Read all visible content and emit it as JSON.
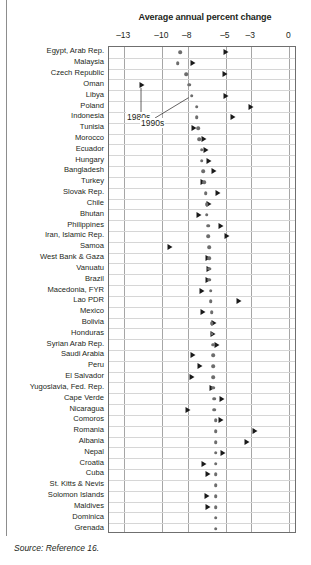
{
  "figure": {
    "source_note": "Source: Reference 16."
  },
  "chart_data": {
    "type": "scatter",
    "title": "Average annual percent change",
    "xlabel": "",
    "ylabel": "",
    "xlim": [
      -14.2,
      0.6
    ],
    "xticks": [
      -13,
      -10,
      -8,
      -5,
      -3,
      0
    ],
    "xtick_labels": [
      "–13",
      "–10",
      "–8",
      "–5",
      "–3",
      "0"
    ],
    "grid": "both",
    "legend_position": "inline-annotation",
    "series": [
      {
        "name": "1980s",
        "marker": "triangle",
        "color": "#1a1a1a"
      },
      {
        "name": "1990s",
        "marker": "circle",
        "color": "#6d6d6d"
      }
    ],
    "annotations": [
      {
        "text": "1980s",
        "points_to_series": "1980s",
        "points_to_category": "Oman"
      },
      {
        "text": "1990s",
        "points_to_series": "1990s",
        "points_to_category": "Libya"
      }
    ],
    "categories": [
      "Egypt, Arab Rep.",
      "Malaysia",
      "Czech Republic",
      "Oman",
      "Libya",
      "Poland",
      "Indonesia",
      "Tunisia",
      "Morocco",
      "Ecuador",
      "Hungary",
      "Bangladesh",
      "Turkey",
      "Slovak Rep.",
      "Chile",
      "Bhutan",
      "Philippines",
      "Iran, Islamic Rep.",
      "Samoa",
      "West Bank & Gaza",
      "Vanuatu",
      "Brazil",
      "Macedonia, FYR",
      "Lao PDR",
      "Mexico",
      "Bolivia",
      "Honduras",
      "Syrian Arab Rep.",
      "Saudi Arabia",
      "Peru",
      "El Salvador",
      "Yugoslavia, Fed. Rep.",
      "Cape Verde",
      "Nicaragua",
      "Comoros",
      "Romania",
      "Albania",
      "Nepal",
      "Croatia",
      "Cuba",
      "St. Kitts & Nevis",
      "Solomon Islands",
      "Maldives",
      "Dominica",
      "Grenada"
    ],
    "points": [
      {
        "category": "Egypt, Arab Rep.",
        "1980s": -5.0,
        "1990s": -8.6
      },
      {
        "category": "Malaysia",
        "1980s": -7.6,
        "1990s": -8.8
      },
      {
        "category": "Czech Republic",
        "1980s": -5.1,
        "1990s": -8.1
      },
      {
        "category": "Oman",
        "1980s": -11.6,
        "1990s": -7.9
      },
      {
        "category": "Libya",
        "1980s": -5.0,
        "1990s": -7.7
      },
      {
        "category": "Poland",
        "1980s": -3.0,
        "1990s": -7.3
      },
      {
        "category": "Indonesia",
        "1980s": -4.4,
        "1990s": -7.3
      },
      {
        "category": "Tunisia",
        "1980s": -7.5,
        "1990s": -7.2
      },
      {
        "category": "Morocco",
        "1980s": -6.7,
        "1990s": -7.1
      },
      {
        "category": "Ecuador",
        "1980s": -6.6,
        "1990s": -6.9
      },
      {
        "category": "Hungary",
        "1980s": -6.3,
        "1990s": -6.9
      },
      {
        "category": "Bangladesh",
        "1980s": -5.9,
        "1990s": -6.8
      },
      {
        "category": "Turkey",
        "1980s": -6.8,
        "1990s": -6.7
      },
      {
        "category": "Slovak Rep.",
        "1980s": -5.6,
        "1990s": -6.6
      },
      {
        "category": "Chile",
        "1980s": -6.3,
        "1990s": -6.5
      },
      {
        "category": "Bhutan",
        "1980s": -7.1,
        "1990s": -6.5
      },
      {
        "category": "Philippines",
        "1980s": -5.4,
        "1990s": -6.4
      },
      {
        "category": "Iran, Islamic Rep.",
        "1980s": -4.9,
        "1990s": -6.4
      },
      {
        "category": "Samoa",
        "1980s": -9.4,
        "1990s": -6.3
      },
      {
        "category": "West Bank & Gaza",
        "1980s": -6.4,
        "1990s": -6.3
      },
      {
        "category": "Vanuatu",
        "1980s": -6.3,
        "1990s": -6.3
      },
      {
        "category": "Brazil",
        "1980s": -6.4,
        "1990s": -6.3
      },
      {
        "category": "Macedonia, FYR",
        "1980s": -6.9,
        "1990s": -6.2
      },
      {
        "category": "Lao PDR",
        "1980s": -4.0,
        "1990s": -6.2
      },
      {
        "category": "Mexico",
        "1980s": -6.8,
        "1990s": -6.1
      },
      {
        "category": "Bolivia",
        "1980s": -5.9,
        "1990s": -6.1
      },
      {
        "category": "Honduras",
        "1980s": -6.0,
        "1990s": -6.1
      },
      {
        "category": "Syrian Arab Rep.",
        "1980s": -5.7,
        "1990s": -6.0
      },
      {
        "category": "Saudi Arabia",
        "1980s": -7.6,
        "1990s": -6.0
      },
      {
        "category": "Peru",
        "1980s": -7.0,
        "1990s": -6.0
      },
      {
        "category": "El Salvador",
        "1980s": -7.7,
        "1990s": -6.0
      },
      {
        "category": "Yugoslavia, Fed. Rep.",
        "1980s": -6.1,
        "1990s": -6.0
      },
      {
        "category": "Cape Verde",
        "1980s": -5.3,
        "1990s": -5.9
      },
      {
        "category": "Nicaragua",
        "1980s": -8.0,
        "1990s": -5.9
      },
      {
        "category": "Comoros",
        "1980s": -5.4,
        "1990s": -5.8
      },
      {
        "category": "Romania",
        "1980s": -2.7,
        "1990s": -5.8
      },
      {
        "category": "Albania",
        "1980s": -3.3,
        "1990s": -5.8
      },
      {
        "category": "Nepal",
        "1980s": -5.2,
        "1990s": -5.8
      },
      {
        "category": "Croatia",
        "1980s": -6.7,
        "1990s": -5.8
      },
      {
        "category": "Cuba",
        "1980s": -6.4,
        "1990s": -5.8
      },
      {
        "category": "St. Kitts & Nevis",
        "1980s": null,
        "1990s": -5.8
      },
      {
        "category": "Solomon Islands",
        "1980s": -6.5,
        "1990s": -5.8
      },
      {
        "category": "Maldives",
        "1980s": -6.4,
        "1990s": -5.8
      },
      {
        "category": "Dominica",
        "1980s": null,
        "1990s": -5.8
      },
      {
        "category": "Grenada",
        "1980s": null,
        "1990s": -5.8
      }
    ]
  }
}
